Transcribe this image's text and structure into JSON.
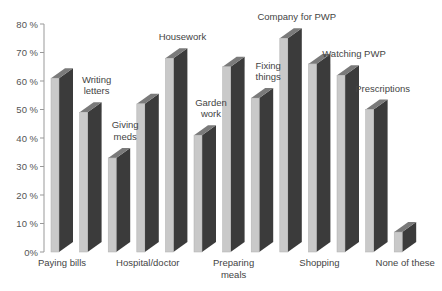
{
  "chart_data": {
    "type": "bar",
    "style": "3d",
    "title": "",
    "xlabel": "",
    "ylabel": "",
    "ylim": [
      0,
      80
    ],
    "y_ticks": [
      "0%",
      "10 %",
      "20 %",
      "30 %",
      "40 %",
      "50 %",
      "60 %",
      "70 %",
      "80 %"
    ],
    "grid": false,
    "legend": "none",
    "categories": [
      "Paying bills",
      "Writing letters",
      "Giving meds",
      "Hospital/doctor",
      "Housework",
      "Garden work",
      "Preparing meals",
      "Fixing things",
      "Company for PWP",
      "Shopping",
      "Watching PWP",
      "Prescriptions",
      "None of these"
    ],
    "label_lines": [
      [
        "Paying bills"
      ],
      [
        "Writing",
        "letters"
      ],
      [
        "Giving",
        "meds"
      ],
      [
        "Hospital/doctor"
      ],
      [
        "Housework"
      ],
      [
        "Garden",
        "work"
      ],
      [
        "Preparing",
        "meals"
      ],
      [
        "Fixing",
        "things"
      ],
      [
        "Company for PWP"
      ],
      [
        "Shopping"
      ],
      [
        "Watching PWP"
      ],
      [
        "Prescriptions"
      ],
      [
        "None of these"
      ]
    ],
    "label_placement": [
      "below",
      "above",
      "above",
      "below",
      "above",
      "above",
      "below",
      "above",
      "above",
      "below",
      "above",
      "above",
      "below"
    ],
    "values": [
      61,
      49,
      33,
      52,
      68,
      41,
      65,
      54,
      75,
      66,
      62,
      50,
      7
    ],
    "colors": {
      "front": "#c9c9c9",
      "side": "#3b3b3b",
      "top": "#7a7a7a",
      "axis": "#999999"
    }
  }
}
